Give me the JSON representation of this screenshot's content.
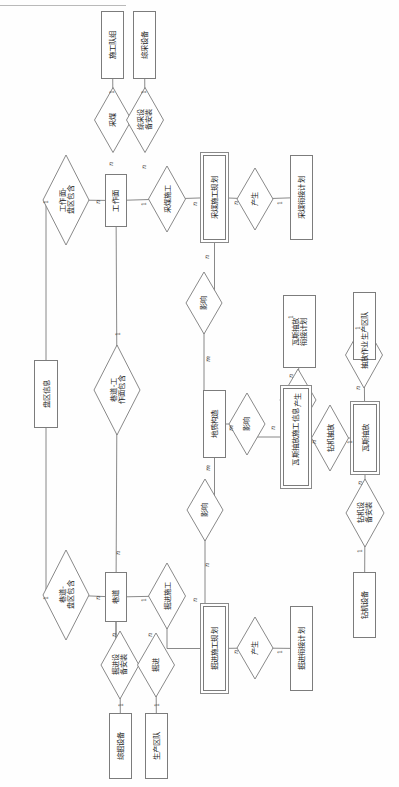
{
  "page": {
    "orientation": "rotated-90",
    "header_rule": true
  },
  "diagram": {
    "type": "entity-relationship",
    "stroke_color": "#7c7c7c",
    "text_color": "#1d1d1d",
    "entities": [
      {
        "id": "e-construction-team",
        "label": "施工队组",
        "x": 101,
        "y": 11,
        "w": 23,
        "h": 68
      },
      {
        "id": "e-mining-equipment",
        "label": "综采设备",
        "x": 133,
        "y": 11,
        "w": 23,
        "h": 68
      },
      {
        "id": "e-working-face",
        "label": "工作面",
        "x": 105,
        "y": 174,
        "w": 22,
        "h": 53
      },
      {
        "id": "e-mining-plan",
        "label": "采煤施工规划",
        "x": 203,
        "y": 155,
        "w": 23,
        "h": 85,
        "weak": true
      },
      {
        "id": "e-mining-schedule",
        "label": "采煤衔接计划",
        "x": 290,
        "y": 155,
        "w": 23,
        "h": 85
      },
      {
        "id": "e-gas-schedule",
        "label": "瓦斯抽放\n衔接计划",
        "x": 283,
        "y": 295,
        "w": 33,
        "h": 73
      },
      {
        "id": "e-prod-team-gas",
        "label": "生产区队",
        "x": 353,
        "y": 292,
        "w": 23,
        "h": 68
      },
      {
        "id": "e-geology",
        "label": "地质构造",
        "x": 203,
        "y": 390,
        "w": 23,
        "h": 68
      },
      {
        "id": "e-gas-drainage-info",
        "label": "瓦斯抽放施工信息",
        "x": 283,
        "y": 388,
        "w": 26,
        "h": 98,
        "weak": true
      },
      {
        "id": "e-gas-drainage",
        "label": "瓦斯抽放",
        "x": 353,
        "y": 404,
        "w": 24,
        "h": 68,
        "weak": true
      },
      {
        "id": "e-panel-info",
        "label": "盘区信息",
        "x": 34,
        "y": 360,
        "w": 24,
        "h": 68
      },
      {
        "id": "e-roadway",
        "label": "巷道",
        "x": 105,
        "y": 572,
        "w": 22,
        "h": 50
      },
      {
        "id": "e-tunnel-plan",
        "label": "掘进施工规划",
        "x": 203,
        "y": 606,
        "w": 23,
        "h": 85,
        "weak": true
      },
      {
        "id": "e-tunnel-schedule",
        "label": "掘进衔接计划",
        "x": 290,
        "y": 606,
        "w": 23,
        "h": 85
      },
      {
        "id": "e-tunnel-equipment",
        "label": "综掘设备",
        "x": 109,
        "y": 713,
        "w": 23,
        "h": 66
      },
      {
        "id": "e-prod-team-tunnel",
        "label": "生产区队",
        "x": 145,
        "y": 713,
        "w": 23,
        "h": 66
      },
      {
        "id": "e-drill-equipment",
        "label": "钻机设备",
        "x": 353,
        "y": 572,
        "w": 23,
        "h": 66
      }
    ],
    "relationships": [
      {
        "id": "r-coal-mining",
        "label": "采煤",
        "cx": 113,
        "cy": 120,
        "w": 37,
        "h": 65
      },
      {
        "id": "r-equip-install",
        "label": "综采设\n备安装",
        "cx": 145,
        "cy": 120,
        "w": 37,
        "h": 65
      },
      {
        "id": "r-face-panel-contains",
        "label": "工作面-\n盘区包含",
        "cx": 66,
        "cy": 200,
        "w": 46,
        "h": 90
      },
      {
        "id": "r-mining-construction",
        "label": "采煤施工",
        "cx": 167,
        "cy": 199,
        "w": 37,
        "h": 66
      },
      {
        "id": "r-produce-mining",
        "label": "产生",
        "cx": 255,
        "cy": 199,
        "w": 36,
        "h": 62
      },
      {
        "id": "r-affect-plan",
        "label": "影响",
        "cx": 204,
        "cy": 303,
        "w": 36,
        "h": 62
      },
      {
        "id": "r-produce-gas",
        "label": "产生",
        "cx": 298,
        "cy": 400,
        "w": 36,
        "h": 62
      },
      {
        "id": "r-drain-operation",
        "label": "抽放作业",
        "cx": 364,
        "cy": 355,
        "w": 37,
        "h": 66
      },
      {
        "id": "r-affect-geo-gas",
        "label": "影响",
        "cx": 247,
        "cy": 424,
        "w": 36,
        "h": 62
      },
      {
        "id": "r-drill-drain",
        "label": "钻机抽放",
        "cx": 330,
        "cy": 438,
        "w": 37,
        "h": 66
      },
      {
        "id": "r-drill-install",
        "label": "钻机设\n备安装",
        "cx": 365,
        "cy": 513,
        "w": 38,
        "h": 68
      },
      {
        "id": "r-affect-geo-tunnel",
        "label": "影响",
        "cx": 205,
        "cy": 510,
        "w": 36,
        "h": 62
      },
      {
        "id": "r-roadway-face-contains",
        "label": "巷道-工\n作面包含",
        "cx": 117,
        "cy": 390,
        "w": 46,
        "h": 90
      },
      {
        "id": "r-roadway-panel-contains",
        "label": "巷道-\n盘区包含",
        "cx": 66,
        "cy": 595,
        "w": 46,
        "h": 90
      },
      {
        "id": "r-tunnel-construction",
        "label": "掘进施工",
        "cx": 167,
        "cy": 596,
        "w": 37,
        "h": 66
      },
      {
        "id": "r-produce-tunnel",
        "label": "产生",
        "cx": 255,
        "cy": 648,
        "w": 36,
        "h": 62
      },
      {
        "id": "r-tunnel-equip-install",
        "label": "掘进设\n备安装",
        "cx": 120,
        "cy": 665,
        "w": 38,
        "h": 68
      },
      {
        "id": "r-tunneling",
        "label": "掘进",
        "cx": 156,
        "cy": 665,
        "w": 37,
        "h": 64
      }
    ],
    "edges": [
      {
        "id": "edge-team-mining",
        "from": "e-construction-team",
        "to": "r-coal-mining",
        "card_from": "1",
        "card_to": "n"
      },
      {
        "id": "edge-equipment-install",
        "from": "e-mining-equipment",
        "to": "r-equip-install",
        "card_from": "1",
        "card_to": "n"
      },
      {
        "id": "edge-face-panel",
        "from": "e-working-face",
        "to": "r-face-panel-contains",
        "card_from": "n",
        "card_to": "1"
      },
      {
        "id": "edge-face-mining-constr",
        "from": "e-working-face",
        "to": "r-mining-construction",
        "card_from": "1",
        "card_to": "n"
      },
      {
        "id": "edge-mining-constr-plan",
        "from": "r-mining-construction",
        "to": "e-mining-plan",
        "card_from": "n",
        "card_to": ""
      },
      {
        "id": "edge-plan-produce",
        "from": "e-mining-plan",
        "to": "r-produce-mining",
        "card_from": "n",
        "card_to": "1"
      },
      {
        "id": "edge-produce-schedule",
        "from": "r-produce-mining",
        "to": "e-mining-schedule",
        "card_from": "1",
        "card_to": ""
      },
      {
        "id": "edge-plan-affect",
        "from": "e-mining-plan",
        "to": "r-affect-plan",
        "card_from": "n",
        "card_to": "m"
      },
      {
        "id": "edge-affect-geology",
        "from": "r-affect-plan",
        "to": "e-geology",
        "card_from": "m",
        "card_to": ""
      },
      {
        "id": "edge-geology-affect-gas",
        "from": "e-geology",
        "to": "r-affect-geo-gas",
        "card_from": "m",
        "card_to": "n"
      },
      {
        "id": "edge-affect-gas-info",
        "from": "r-affect-geo-gas",
        "to": "e-gas-drainage-info",
        "card_from": "n",
        "card_to": ""
      },
      {
        "id": "edge-gas-info-produce",
        "from": "e-gas-drainage-info",
        "to": "r-produce-gas",
        "card_from": "n",
        "card_to": "1"
      },
      {
        "id": "edge-produce-gas-schedule",
        "from": "r-produce-gas",
        "to": "e-gas-schedule",
        "card_from": "1",
        "card_to": ""
      },
      {
        "id": "edge-gas-info-drill",
        "from": "e-gas-drainage-info",
        "to": "r-drill-drain",
        "card_from": "n",
        "card_to": "1"
      },
      {
        "id": "edge-drill-gas-drainage",
        "from": "r-drill-drain",
        "to": "e-gas-drainage",
        "card_from": "1",
        "card_to": ""
      },
      {
        "id": "edge-gas-drain-operation",
        "from": "e-gas-drainage",
        "to": "r-drain-operation",
        "card_from": "n",
        "card_to": "1"
      },
      {
        "id": "edge-operation-prodteam",
        "from": "r-drain-operation",
        "to": "e-prod-team-gas",
        "card_from": "1",
        "card_to": ""
      },
      {
        "id": "edge-gas-drill-install",
        "from": "e-gas-drainage",
        "to": "r-drill-install",
        "card_from": "n",
        "card_to": "1"
      },
      {
        "id": "edge-drill-install-equip",
        "from": "r-drill-install",
        "to": "e-drill-equipment",
        "card_from": "1",
        "card_to": ""
      },
      {
        "id": "edge-geology-affect-tunnel",
        "from": "e-geology",
        "to": "r-affect-geo-tunnel",
        "card_from": "m",
        "card_to": "n"
      },
      {
        "id": "edge-affect-tunnel-plan",
        "from": "r-affect-geo-tunnel",
        "to": "e-tunnel-plan",
        "card_from": "n",
        "card_to": ""
      },
      {
        "id": "edge-panel-face",
        "from": "e-panel-info",
        "to": "r-face-panel-contains",
        "card_from": "1",
        "card_to": ""
      },
      {
        "id": "edge-panel-roadway",
        "from": "e-panel-info",
        "to": "r-roadway-panel-contains",
        "card_from": "1",
        "card_to": ""
      },
      {
        "id": "edge-face-roadway-contains",
        "from": "e-working-face",
        "to": "r-roadway-face-contains",
        "card_from": "1",
        "card_to": "n"
      },
      {
        "id": "edge-roadway-contains",
        "from": "r-roadway-face-contains",
        "to": "e-roadway",
        "card_from": "n",
        "card_to": ""
      },
      {
        "id": "edge-roadway-panel",
        "from": "e-roadway",
        "to": "r-roadway-panel-contains",
        "card_from": "n",
        "card_to": "1"
      },
      {
        "id": "edge-roadway-tunnel-con",
        "from": "e-roadway",
        "to": "r-tunnel-construction",
        "card_from": "1",
        "card_to": "n"
      },
      {
        "id": "edge-tunnel-con-plan",
        "from": "r-tunnel-construction",
        "to": "e-tunnel-plan",
        "card_from": "n",
        "card_to": ""
      },
      {
        "id": "edge-tunnel-plan-produce",
        "from": "e-tunnel-plan",
        "to": "r-produce-tunnel",
        "card_from": "n",
        "card_to": "1"
      },
      {
        "id": "edge-produce-tunnel-sched",
        "from": "r-produce-tunnel",
        "to": "e-tunnel-schedule",
        "card_from": "1",
        "card_to": ""
      },
      {
        "id": "edge-roadway-equip-install",
        "from": "e-roadway",
        "to": "r-tunnel-equip-install",
        "card_from": "n",
        "card_to": "1"
      },
      {
        "id": "edge-equip-install-combine",
        "from": "r-tunnel-equip-install",
        "to": "e-tunnel-equipment",
        "card_from": "1",
        "card_to": ""
      },
      {
        "id": "edge-roadway-tunneling",
        "from": "e-roadway",
        "to": "r-tunneling",
        "card_from": "n",
        "card_to": "1"
      },
      {
        "id": "edge-tunneling-prodteam",
        "from": "r-tunneling",
        "to": "e-prod-team-tunnel",
        "card_from": "1",
        "card_to": ""
      }
    ],
    "cardinality_marks": [
      {
        "id": "c-1-team-mining",
        "text": "1",
        "x": 110,
        "y": 88
      },
      {
        "id": "c-1-equip-install",
        "text": "1",
        "x": 142,
        "y": 88
      },
      {
        "id": "c-n-mining-face",
        "text": "n",
        "x": 109,
        "y": 160
      },
      {
        "id": "c-n-equip-face",
        "text": "n",
        "x": 142,
        "y": 163
      },
      {
        "id": "c-n-face-panel",
        "text": "n",
        "x": 96,
        "y": 198
      },
      {
        "id": "c-1-panel-face",
        "text": "1",
        "x": 44,
        "y": 198
      },
      {
        "id": "c-1-face-constr",
        "text": "1",
        "x": 142,
        "y": 200
      },
      {
        "id": "c-n-constr-plan",
        "text": "n",
        "x": 193,
        "y": 200
      },
      {
        "id": "c-n-plan-produce",
        "text": "n",
        "x": 234,
        "y": 199
      },
      {
        "id": "c-1-produce-sched",
        "text": "1",
        "x": 278,
        "y": 199
      },
      {
        "id": "c-n-plan-affect",
        "text": "n",
        "x": 205,
        "y": 253
      },
      {
        "id": "c-m-affect-geo",
        "text": "m",
        "x": 205,
        "y": 355
      },
      {
        "id": "c-m-geo-affect2",
        "text": "m",
        "x": 228,
        "y": 424
      },
      {
        "id": "c-n-affect2-info",
        "text": "n",
        "x": 271,
        "y": 424
      },
      {
        "id": "c-n-info-produce",
        "text": "n",
        "x": 289,
        "y": 372
      },
      {
        "id": "c-1-produce-gassch",
        "text": "1",
        "x": 289,
        "y": 313
      },
      {
        "id": "c-n-info-drill",
        "text": "n",
        "x": 312,
        "y": 438
      },
      {
        "id": "c-1-drill-gas",
        "text": "1",
        "x": 348,
        "y": 438
      },
      {
        "id": "c-n-gas-operation",
        "text": "n",
        "x": 356,
        "y": 384
      },
      {
        "id": "c-1-operation-team",
        "text": "1",
        "x": 356,
        "y": 324
      },
      {
        "id": "c-n-gas-drillinst",
        "text": "n",
        "x": 358,
        "y": 479
      },
      {
        "id": "c-1-drillinst-equip",
        "text": "1",
        "x": 358,
        "y": 547
      },
      {
        "id": "c-m-geo-tunnel",
        "text": "m",
        "x": 205,
        "y": 464
      },
      {
        "id": "c-n-tunnelaffect-pl",
        "text": "n",
        "x": 205,
        "y": 561
      },
      {
        "id": "c-1-face-roadway",
        "text": "1",
        "x": 116,
        "y": 330
      },
      {
        "id": "c-n-roadway-contains",
        "text": "n",
        "x": 116,
        "y": 549
      },
      {
        "id": "c-n-roadway-panel",
        "text": "n",
        "x": 96,
        "y": 594
      },
      {
        "id": "c-1-panel-roadway",
        "text": "1",
        "x": 44,
        "y": 594
      },
      {
        "id": "c-1-roadway-tunnelc",
        "text": "1",
        "x": 142,
        "y": 596
      },
      {
        "id": "c-n-tunnelc-plan",
        "text": "n",
        "x": 193,
        "y": 596
      },
      {
        "id": "c-n-tplan-produce",
        "text": "n",
        "x": 234,
        "y": 648
      },
      {
        "id": "c-1-produce-tsched",
        "text": "1",
        "x": 278,
        "y": 648
      },
      {
        "id": "c-n-roadway-teq",
        "text": "n",
        "x": 112,
        "y": 631
      },
      {
        "id": "c-1-teq-equipment",
        "text": "1",
        "x": 119,
        "y": 701
      },
      {
        "id": "c-n-roadway-tunnel",
        "text": "n",
        "x": 148,
        "y": 631
      },
      {
        "id": "c-1-tunnel-team",
        "text": "1",
        "x": 155,
        "y": 701
      }
    ]
  }
}
